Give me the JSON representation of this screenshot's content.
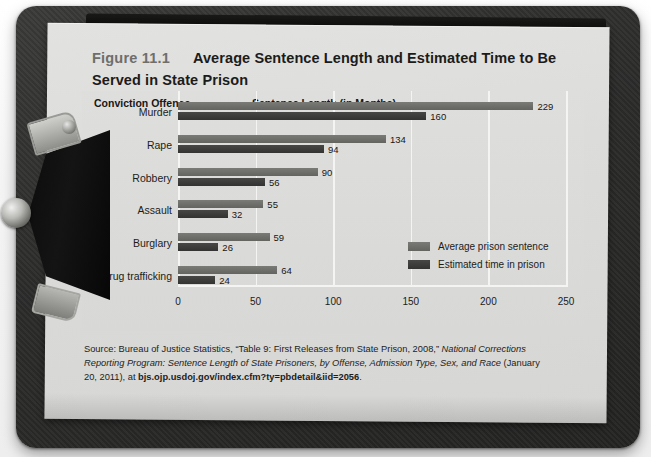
{
  "figure": {
    "number": "Figure 11.1",
    "title": "Average Sentence Length and Estimated Time to Be Served in State Prison"
  },
  "columns": {
    "left_header": "Conviction Offense",
    "right_header": "Sentence Length (in Months)"
  },
  "chart_data": {
    "type": "bar",
    "orientation": "horizontal",
    "title": "Average Sentence Length and Estimated Time to Be Served in State Prison",
    "xlabel": "Sentence Length (in Months)",
    "ylabel": "Conviction Offense",
    "categories": [
      "Murder",
      "Rape",
      "Robbery",
      "Assault",
      "Burglary",
      "Drug trafficking"
    ],
    "series": [
      {
        "name": "Average prison sentence",
        "color": "#6b6b68",
        "values": [
          229,
          134,
          90,
          55,
          59,
          64
        ]
      },
      {
        "name": "Estimated time in prison",
        "color": "#3a3a38",
        "values": [
          160,
          94,
          56,
          32,
          26,
          24
        ]
      }
    ],
    "xlim": [
      0,
      250
    ],
    "xticks": [
      0,
      50,
      100,
      150,
      200,
      250
    ],
    "xtick_labels": [
      "0",
      "50",
      "100",
      "150",
      "200",
      "250"
    ],
    "grid": true,
    "grid_color": "#f4f4f2",
    "legend_position": "inside-right",
    "plot_background": "#dcdcda"
  },
  "source": {
    "prefix": "Source: Bureau of Justice Statistics, “Table 9: First Releases from State Prison, 2008,” ",
    "italic": "National Corrections Reporting Program: Sentence Length of State Prisoners, by Offense, Admission Type, Sex, and Race",
    "middle": " (January 20, 2011), at ",
    "bold": "bjs.ojp.usdoj.gov/index.cfm?ty=pbdetail&iid=2056",
    "suffix": "."
  },
  "credit": "Martin Llado/iStockphoto"
}
